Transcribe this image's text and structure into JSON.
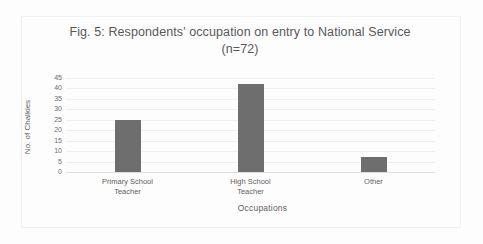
{
  "figure": {
    "title_line1": "Fig. 5: Respondents' occupation on entry to National Service",
    "title_line2": "(n=72)"
  },
  "chart_data": {
    "type": "bar",
    "title": "Fig. 5: Respondents' occupation on entry to National Service (n=72)",
    "xlabel": "Occupations",
    "ylabel": "No. of Chalkies",
    "categories": [
      "Primary School Teacher",
      "High School Teacher",
      "Other"
    ],
    "category_lines": [
      [
        "Primary School",
        "Teacher"
      ],
      [
        "High School",
        "Teacher"
      ],
      [
        "Other",
        ""
      ]
    ],
    "values": [
      25,
      42,
      7
    ],
    "ylim": [
      0,
      45
    ],
    "ytick_step": 5,
    "yticks": [
      45,
      40,
      35,
      30,
      25,
      20,
      15,
      10,
      5,
      0
    ],
    "grid": true,
    "grid_orientation": "horizontal",
    "legend": "none",
    "bar_color": "#6e6e6e",
    "gridline_color": "#f0f0f0",
    "axis_color": "#dedede",
    "background_color": "#fdfdfd",
    "sample_size": 72
  }
}
